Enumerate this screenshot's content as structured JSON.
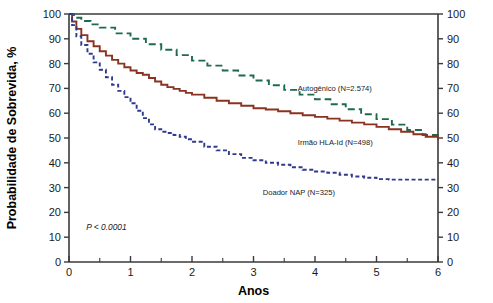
{
  "chart_data": {
    "type": "line",
    "title": "",
    "xlabel": "Anos",
    "ylabel": "Probabilidade de Sobrevida, %",
    "xlim": [
      0,
      6
    ],
    "ylim": [
      0,
      100
    ],
    "grid": false,
    "legend_position": "inline-annotations",
    "x_ticks": [
      0,
      1,
      2,
      3,
      4,
      5,
      6
    ],
    "x_tick_labels": [
      "0",
      "1",
      "2",
      "3",
      "4",
      "5",
      "6"
    ],
    "x_minor_ticks": [
      0.5,
      1.5,
      2.5,
      3.5,
      4.5,
      5.5
    ],
    "y_ticks": [
      0,
      10,
      20,
      30,
      40,
      50,
      60,
      70,
      80,
      90,
      100
    ],
    "y_tick_labels": [
      "0",
      "10",
      "20",
      "30",
      "40",
      "50",
      "60",
      "70",
      "80",
      "90",
      "100"
    ],
    "right_axis_ticks": [
      0,
      10,
      20,
      30,
      40,
      50,
      60,
      70,
      80,
      90,
      100
    ],
    "right_axis_tick_labels": [
      "0",
      "10",
      "20",
      "30",
      "40",
      "50",
      "60",
      "70",
      "80",
      "90",
      "100"
    ],
    "annotations": [
      {
        "text": "P < 0.0001",
        "x": 0.28,
        "y": 13
      }
    ],
    "series": [
      {
        "name": "Autogenico",
        "label": "Autogênico (N=2.574)",
        "color": "#1d6b4c",
        "style": "dashed",
        "dasharray": "7,4",
        "label_x": 3.72,
        "label_y": 69,
        "x": [
          0,
          0.08,
          0.2,
          0.35,
          0.5,
          0.75,
          1.0,
          1.25,
          1.5,
          1.75,
          2.0,
          2.25,
          2.5,
          2.75,
          3.0,
          3.25,
          3.5,
          3.75,
          4.0,
          4.25,
          4.5,
          4.75,
          5.0,
          5.25,
          5.5,
          5.75,
          6.0
        ],
        "y": [
          100,
          98.5,
          97.2,
          95.8,
          94.5,
          92.2,
          90.0,
          87.8,
          85.6,
          83.4,
          81.2,
          79.2,
          77.2,
          75.2,
          73.2,
          71.3,
          69.4,
          67.5,
          65.6,
          63.6,
          61.6,
          59.6,
          57.6,
          55.4,
          53.2,
          51.2,
          49.5
        ]
      },
      {
        "name": "Irmao HLA-Id",
        "label": "Irmão HLA-Id (N=498)",
        "color": "#8b3322",
        "style": "solid",
        "dasharray": "",
        "label_x": 3.72,
        "label_y": 47,
        "x": [
          0,
          0.05,
          0.12,
          0.2,
          0.3,
          0.4,
          0.5,
          0.6,
          0.7,
          0.8,
          0.9,
          1.0,
          1.1,
          1.2,
          1.3,
          1.4,
          1.5,
          1.6,
          1.7,
          1.8,
          1.9,
          2.0,
          2.2,
          2.4,
          2.6,
          2.8,
          3.0,
          3.2,
          3.4,
          3.6,
          3.8,
          4.0,
          4.2,
          4.4,
          4.6,
          4.8,
          5.0,
          5.2,
          5.4,
          5.6,
          5.8,
          6.0
        ],
        "y": [
          100,
          97.0,
          94.0,
          91.5,
          89.0,
          87.0,
          85.0,
          83.2,
          81.5,
          80.0,
          78.5,
          77.2,
          76.2,
          75.5,
          74.2,
          72.8,
          71.5,
          70.5,
          69.8,
          69.0,
          68.2,
          67.5,
          66.2,
          65.0,
          64.0,
          63.0,
          62.0,
          61.5,
          60.8,
          60.0,
          59.2,
          58.5,
          57.8,
          57.0,
          56.2,
          55.5,
          54.5,
          53.5,
          52.5,
          51.5,
          50.5,
          49.2
        ]
      },
      {
        "name": "Doador NAP",
        "label": "Doador NAP (N=325)",
        "color": "#303a8c",
        "style": "dashed",
        "dasharray": "4,2.6",
        "label_x": 3.15,
        "label_y": 27,
        "x": [
          0,
          0.05,
          0.12,
          0.2,
          0.3,
          0.4,
          0.5,
          0.6,
          0.7,
          0.8,
          0.9,
          1.0,
          1.1,
          1.2,
          1.3,
          1.4,
          1.5,
          1.6,
          1.7,
          1.8,
          1.9,
          2.0,
          2.2,
          2.4,
          2.6,
          2.8,
          3.0,
          3.2,
          3.4,
          3.6,
          3.8,
          4.0,
          4.2,
          4.4,
          4.6,
          4.8,
          5.0,
          5.2,
          5.5,
          6.0
        ],
        "y": [
          100,
          95.5,
          91.0,
          87.5,
          84.0,
          80.5,
          77.5,
          74.5,
          71.5,
          69.0,
          66.5,
          64.0,
          61.0,
          58.0,
          55.5,
          53.5,
          52.5,
          52.0,
          51.2,
          50.5,
          49.5,
          48.5,
          46.5,
          45.0,
          43.5,
          42.0,
          41.0,
          40.0,
          39.2,
          38.2,
          37.2,
          36.5,
          36.0,
          35.2,
          34.5,
          34.0,
          33.4,
          33.2,
          33.2,
          33.2
        ]
      }
    ]
  }
}
